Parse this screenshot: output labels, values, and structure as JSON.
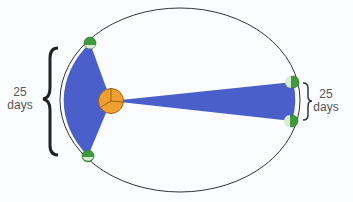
{
  "diagram": {
    "left_label": {
      "value": "25",
      "unit": "days"
    },
    "right_label": {
      "value": "25",
      "unit": "days"
    },
    "colors": {
      "background": "#fbfcfd",
      "orbit": "#333333",
      "swept_area": "#4a5fc9",
      "sun": "#f0a030",
      "sun_stroke": "#a0601a",
      "planet_dark": "#3d9a3d",
      "planet_light": "#d8ecd4",
      "brace": "#222222"
    },
    "elements": [
      "orbit",
      "sun",
      "planet-at-perihelion-start",
      "planet-at-perihelion-end",
      "planet-at-aphelion-start",
      "planet-at-aphelion-end",
      "swept-area-near",
      "swept-area-far"
    ]
  }
}
